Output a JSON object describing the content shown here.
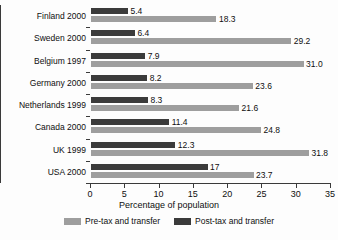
{
  "chart_data": {
    "type": "bar",
    "orientation": "horizontal",
    "title": "",
    "xlabel": "Percentage of population",
    "ylabel": "",
    "xlim": [
      0,
      35
    ],
    "xticks": [
      0,
      5,
      10,
      15,
      20,
      25,
      30,
      35
    ],
    "grid": false,
    "legend_position": "bottom",
    "categories": [
      "Finland 2000",
      "Sweden 2000",
      "Belgium 1997",
      "Germany 2000",
      "Netherlands 1999",
      "Canada 2000",
      "UK 1999",
      "USA 2000"
    ],
    "series": [
      {
        "name": "Post-tax and transfer",
        "color": "#3b3b3b",
        "values": [
          5.4,
          6.4,
          7.9,
          8.2,
          8.3,
          11.4,
          12.3,
          17
        ],
        "labels": [
          "5.4",
          "6.4",
          "7.9",
          "8.2",
          "8.3",
          "11.4",
          "12.3",
          "17"
        ]
      },
      {
        "name": "Pre-tax and transfer",
        "color": "#9e9e9e",
        "values": [
          18.3,
          29.2,
          31.0,
          23.6,
          21.6,
          24.8,
          31.8,
          23.7
        ],
        "labels": [
          "18.3",
          "29.2",
          "31.0",
          "23.6",
          "21.6",
          "24.8",
          "31.8",
          "23.7"
        ]
      }
    ],
    "legend": [
      {
        "label": "Pre-tax and transfer",
        "color": "#9e9e9e"
      },
      {
        "label": "Post-tax and transfer",
        "color": "#3b3b3b"
      }
    ]
  }
}
